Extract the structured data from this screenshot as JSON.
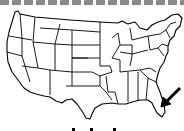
{
  "map": {
    "title": "United States map",
    "region": "Contiguous United States",
    "highlighted_state": "Florida",
    "annotation": "arrow pointing to Florida",
    "stroke_color": "#000000",
    "fill_color": "#ffffff"
  },
  "decor": {
    "top_border": "dashed gray line",
    "dash_color": "#8a8a8a",
    "dash_count": 16
  }
}
